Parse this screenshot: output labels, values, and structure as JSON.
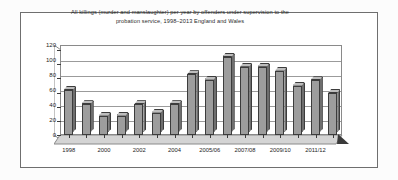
{
  "figure": {
    "frame_color": "#6f6f6f",
    "background": "#ffffff"
  },
  "chart_data": {
    "type": "bar",
    "title": "All killings (murder and manslaughter) per year by offenders under supervision to the probation service, 1998–2013 England and Wales",
    "title_line1": "All killings (murder and manslaughter) per year by offenders under supervision to the",
    "title_line2": "probation service, 1998–2013 England and Wales",
    "xlabel": "",
    "ylabel": "",
    "ylim": [
      0,
      120
    ],
    "yticks": [
      0,
      20,
      40,
      60,
      80,
      100,
      120
    ],
    "grid": true,
    "legend": false,
    "bar_color": "#9d9d9d",
    "bar_edge_color": "#3c3c3c",
    "categories": [
      "1998",
      "1999",
      "2000",
      "2001",
      "2002",
      "2003",
      "2004",
      "2005/06",
      "2006/07",
      "2007/08",
      "2008/09",
      "2009/10",
      "2010/11",
      "2011/12",
      "2012/13",
      "2013"
    ],
    "tick_labels": [
      "1998",
      "",
      "2000",
      "",
      "2002",
      "",
      "2004",
      "",
      "2005/06",
      "",
      "2007/08",
      "",
      "2009/10",
      "",
      "2011/12",
      ""
    ],
    "values": [
      60,
      41,
      26,
      26,
      41,
      30,
      41,
      81,
      74,
      104,
      91,
      91,
      86,
      66,
      73,
      56
    ]
  }
}
